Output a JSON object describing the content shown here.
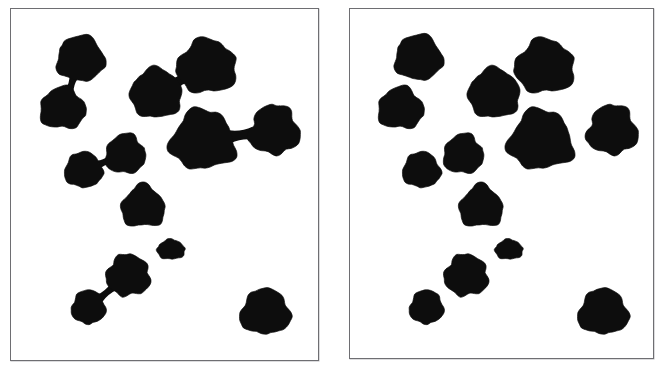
{
  "figure": {
    "background_color": "#ffffff",
    "blob_color": "#0d0d0d",
    "frame_color": "#6e6e72",
    "frame_shadow_color": "#b9b9bd",
    "panel_count": 2,
    "width": 665,
    "height": 370
  },
  "panels": [
    {
      "id": "left",
      "name": "original-binary-image",
      "caption": "",
      "x": 10,
      "y": 8,
      "width": 309,
      "height": 353,
      "blob_count": 13,
      "connection_count": 4,
      "description": "Binary image of dark blobs; several blobs are joined by thin necks",
      "blobs": [
        {
          "id": "L1",
          "label": "top-left-upper-blob",
          "cx": 70,
          "cy": 50,
          "rx": 24,
          "ry": 23,
          "seed": 11
        },
        {
          "id": "L2",
          "label": "top-left-lower-blob",
          "cx": 52,
          "cy": 100,
          "rx": 23,
          "ry": 21,
          "seed": 23
        },
        {
          "id": "L3",
          "label": "upper-middle-blob",
          "cx": 146,
          "cy": 85,
          "rx": 26,
          "ry": 25,
          "seed": 37
        },
        {
          "id": "L4",
          "label": "upper-right-large-blob",
          "cx": 197,
          "cy": 58,
          "rx": 30,
          "ry": 27,
          "seed": 41
        },
        {
          "id": "L5",
          "label": "center-large-blob",
          "cx": 193,
          "cy": 132,
          "rx": 32,
          "ry": 30,
          "seed": 53
        },
        {
          "id": "L6",
          "label": "right-edge-blob",
          "cx": 265,
          "cy": 122,
          "rx": 25,
          "ry": 25,
          "seed": 67
        },
        {
          "id": "L7",
          "label": "mid-left-small-blob",
          "cx": 73,
          "cy": 162,
          "rx": 19,
          "ry": 18,
          "seed": 71
        },
        {
          "id": "L8",
          "label": "mid-center-blob",
          "cx": 115,
          "cy": 146,
          "rx": 20,
          "ry": 20,
          "seed": 83
        },
        {
          "id": "L9",
          "label": "lower-center-blob",
          "cx": 133,
          "cy": 199,
          "rx": 22,
          "ry": 21,
          "seed": 97
        },
        {
          "id": "L10",
          "label": "small-isolated-blob",
          "cx": 161,
          "cy": 242,
          "rx": 14,
          "ry": 10,
          "seed": 101
        },
        {
          "id": "L11",
          "label": "bottom-left-cluster-upper-blob",
          "cx": 118,
          "cy": 268,
          "rx": 22,
          "ry": 21,
          "seed": 113
        },
        {
          "id": "L12",
          "label": "bottom-left-cluster-lower-blob",
          "cx": 78,
          "cy": 300,
          "rx": 17,
          "ry": 17,
          "seed": 127
        },
        {
          "id": "L13",
          "label": "bottom-right-blob",
          "cx": 256,
          "cy": 305,
          "rx": 25,
          "ry": 23,
          "seed": 131
        }
      ],
      "connections": [
        {
          "from": "L1",
          "to": "L2",
          "label": "neck-top-left-pair",
          "width": 4
        },
        {
          "from": "L3",
          "to": "L4",
          "label": "neck-upper-middle-pair",
          "width": 6
        },
        {
          "from": "L5",
          "to": "L6",
          "label": "neck-center-right-pair",
          "width": 6
        },
        {
          "from": "L7",
          "to": "L8",
          "label": "neck-mid-left-pair",
          "width": 4
        },
        {
          "from": "L11",
          "to": "L12",
          "label": "neck-bottom-left-pair",
          "width": 4
        }
      ]
    },
    {
      "id": "right",
      "name": "separated-binary-image",
      "caption": "",
      "x": 349,
      "y": 8,
      "width": 305,
      "height": 351,
      "blob_count": 13,
      "connection_count": 0,
      "description": "Same binary image after separation; the thin necks joining blobs have been cut",
      "blobs": [
        {
          "id": "R1",
          "label": "top-left-upper-blob",
          "cx": 69,
          "cy": 49,
          "rx": 24,
          "ry": 23,
          "seed": 11
        },
        {
          "id": "R2",
          "label": "top-left-lower-blob",
          "cx": 51,
          "cy": 100,
          "rx": 23,
          "ry": 21,
          "seed": 23
        },
        {
          "id": "R3",
          "label": "upper-middle-blob",
          "cx": 145,
          "cy": 85,
          "rx": 26,
          "ry": 25,
          "seed": 37
        },
        {
          "id": "R4",
          "label": "upper-right-large-blob",
          "cx": 196,
          "cy": 58,
          "rx": 30,
          "ry": 27,
          "seed": 41
        },
        {
          "id": "R5",
          "label": "center-large-blob",
          "cx": 192,
          "cy": 132,
          "rx": 32,
          "ry": 30,
          "seed": 53
        },
        {
          "id": "R6",
          "label": "right-edge-blob",
          "cx": 264,
          "cy": 122,
          "rx": 25,
          "ry": 25,
          "seed": 67
        },
        {
          "id": "R7",
          "label": "mid-left-small-blob",
          "cx": 72,
          "cy": 162,
          "rx": 19,
          "ry": 18,
          "seed": 71
        },
        {
          "id": "R8",
          "label": "mid-center-blob",
          "cx": 114,
          "cy": 146,
          "rx": 20,
          "ry": 20,
          "seed": 83
        },
        {
          "id": "R9",
          "label": "lower-center-blob",
          "cx": 132,
          "cy": 199,
          "rx": 22,
          "ry": 21,
          "seed": 97
        },
        {
          "id": "R10",
          "label": "small-isolated-blob",
          "cx": 160,
          "cy": 242,
          "rx": 14,
          "ry": 10,
          "seed": 101
        },
        {
          "id": "R11",
          "label": "bottom-left-cluster-upper-blob",
          "cx": 117,
          "cy": 268,
          "rx": 22,
          "ry": 21,
          "seed": 113
        },
        {
          "id": "R12",
          "label": "bottom-left-cluster-lower-blob",
          "cx": 77,
          "cy": 300,
          "rx": 17,
          "ry": 17,
          "seed": 127
        },
        {
          "id": "R13",
          "label": "bottom-right-blob",
          "cx": 255,
          "cy": 305,
          "rx": 25,
          "ry": 23,
          "seed": 131
        }
      ],
      "connections": []
    }
  ]
}
